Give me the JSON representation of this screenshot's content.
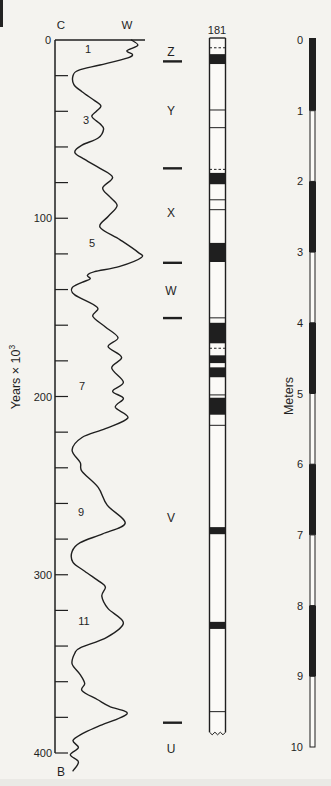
{
  "figure": {
    "background": "#f4f3ef",
    "ink": "#1f1f1f"
  },
  "labels": {
    "left_axis_top": "C",
    "curve_top_right": "W",
    "left_axis_origin": "0",
    "years_axis_text": "Years × 10",
    "years_axis_sup": "3",
    "bottom_left": "B"
  },
  "chart_data": {
    "type": "line",
    "title": "",
    "ylabel": "Years × 10³",
    "xlabel_left": "C",
    "xlabel_right": "W",
    "ylim": [
      0,
      400
    ],
    "y_major_ticks": [
      0,
      100,
      200,
      300,
      400
    ],
    "y_minor_step_kyr": 20,
    "series": [
      {
        "name": "oxygen-isotope-curve",
        "points_age_warmth": [
          [
            0,
            85
          ],
          [
            3,
            92
          ],
          [
            6,
            80
          ],
          [
            8,
            86
          ],
          [
            10,
            81
          ],
          [
            14,
            50
          ],
          [
            17,
            26
          ],
          [
            20,
            20
          ],
          [
            25,
            21
          ],
          [
            29,
            30
          ],
          [
            34,
            44
          ],
          [
            37,
            51
          ],
          [
            40,
            46
          ],
          [
            43,
            41
          ],
          [
            47,
            50
          ],
          [
            50,
            54
          ],
          [
            55,
            48
          ],
          [
            59,
            30
          ],
          [
            63,
            22
          ],
          [
            67,
            33
          ],
          [
            72,
            50
          ],
          [
            77,
            64
          ],
          [
            83,
            53
          ],
          [
            88,
            61
          ],
          [
            93,
            69
          ],
          [
            99,
            59
          ],
          [
            105,
            50
          ],
          [
            112,
            72
          ],
          [
            119,
            92
          ],
          [
            122,
            96
          ],
          [
            127,
            72
          ],
          [
            130,
            44
          ],
          [
            132,
            36
          ],
          [
            134,
            39
          ],
          [
            136,
            30
          ],
          [
            139,
            19
          ],
          [
            143,
            22
          ],
          [
            150,
            47
          ],
          [
            155,
            42
          ],
          [
            161,
            56
          ],
          [
            167,
            70
          ],
          [
            172,
            59
          ],
          [
            178,
            74
          ],
          [
            184,
            63
          ],
          [
            192,
            76
          ],
          [
            197,
            64
          ],
          [
            201,
            76
          ],
          [
            206,
            67
          ],
          [
            212,
            81
          ],
          [
            218,
            56
          ],
          [
            223,
            30
          ],
          [
            230,
            19
          ],
          [
            237,
            28
          ],
          [
            242,
            30
          ],
          [
            251,
            48
          ],
          [
            261,
            58
          ],
          [
            271,
            78
          ],
          [
            277,
            53
          ],
          [
            282,
            28
          ],
          [
            287,
            19
          ],
          [
            293,
            20
          ],
          [
            298,
            33
          ],
          [
            304,
            50
          ],
          [
            307,
            56
          ],
          [
            312,
            52
          ],
          [
            319,
            59
          ],
          [
            327,
            76
          ],
          [
            335,
            58
          ],
          [
            341,
            28
          ],
          [
            344,
            22
          ],
          [
            350,
            19
          ],
          [
            356,
            28
          ],
          [
            361,
            33
          ],
          [
            365,
            30
          ],
          [
            370,
            47
          ],
          [
            374,
            61
          ],
          [
            378,
            80
          ],
          [
            385,
            48
          ],
          [
            389,
            31
          ],
          [
            393,
            20
          ],
          [
            397,
            26
          ],
          [
            401,
            17
          ],
          [
            405,
            26
          ],
          [
            410,
            20
          ]
        ]
      }
    ],
    "stage_labels": [
      {
        "label": "1",
        "age_kyr": 5,
        "x_px": 88
      },
      {
        "label": "3",
        "age_kyr": 45,
        "x_px": 86
      },
      {
        "label": "5",
        "age_kyr": 114,
        "x_px": 92
      },
      {
        "label": "7",
        "age_kyr": 194,
        "x_px": 82
      },
      {
        "label": "9",
        "age_kyr": 265,
        "x_px": 81
      },
      {
        "label": "11",
        "age_kyr": 326,
        "x_px": 84
      }
    ],
    "zone_letters": [
      {
        "label": "Z",
        "age_kyr": 7
      },
      {
        "label": "Y",
        "age_kyr": 40
      },
      {
        "label": "X",
        "age_kyr": 97
      },
      {
        "label": "W",
        "age_kyr": 141
      },
      {
        "label": "V",
        "age_kyr": 268
      },
      {
        "label": "U",
        "age_kyr": 398
      }
    ],
    "zone_boundaries_age_kyr": [
      12,
      72,
      125,
      156,
      383
    ],
    "core_column": {
      "title": "181",
      "length_m": 9.79,
      "black_bands_m": [
        [
          0.2,
          0.34
        ],
        [
          1.88,
          2.04
        ],
        [
          2.87,
          3.14
        ],
        [
          4.0,
          4.29
        ],
        [
          4.46,
          4.57
        ],
        [
          4.63,
          4.77
        ],
        [
          5.06,
          5.3
        ],
        [
          6.89,
          6.99
        ],
        [
          8.23,
          8.33
        ]
      ],
      "contact_lines_m": [
        0.99,
        1.24,
        2.26,
        2.4,
        3.93,
        5.02,
        5.45,
        9.5
      ],
      "broken_lines_m": [
        0.11,
        1.83,
        4.36
      ],
      "bottom_torn": true
    },
    "meters_scale": {
      "label": "Meters",
      "ticks": [
        0,
        1,
        2,
        3,
        4,
        5,
        6,
        7,
        8,
        9,
        10
      ],
      "black_intervals_m": [
        [
          0,
          1
        ],
        [
          2,
          3
        ],
        [
          4,
          5
        ],
        [
          6,
          7
        ],
        [
          8,
          9
        ]
      ]
    }
  }
}
